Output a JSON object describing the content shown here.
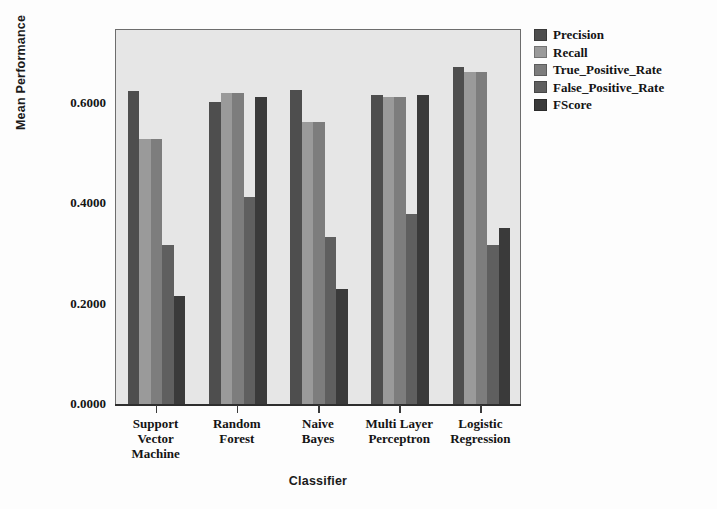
{
  "chart_data": {
    "type": "bar",
    "title": "",
    "xlabel": "Classifier",
    "ylabel": "Mean Performance",
    "ylim": [
      0.0,
      0.75
    ],
    "yticks": [
      "0.0000",
      "0.2000",
      "0.4000",
      "0.6000"
    ],
    "ytick_values": [
      0.0,
      0.2,
      0.4,
      0.6
    ],
    "grid": false,
    "legend_position": "right",
    "categories": [
      "Support Vector Machine",
      "Random Forest",
      "Naive Bayes",
      "Multi Layer Perceptron",
      "Logistic Regression"
    ],
    "category_lines": [
      "Support\nVector\nMachine",
      "Random\nForest",
      "Naive\nBayes",
      "Multi Layer\nPerceptron",
      "Logistic\nRegression"
    ],
    "series": [
      {
        "name": "Precision",
        "color": "#4e4e4e",
        "values": [
          0.625,
          0.603,
          0.626,
          0.617,
          0.673
        ]
      },
      {
        "name": "Recall",
        "color": "#9a9a9a",
        "values": [
          0.528,
          0.621,
          0.562,
          0.613,
          0.662
        ]
      },
      {
        "name": "True_Positive_Rate",
        "color": "#7d7d7d",
        "values": [
          0.528,
          0.621,
          0.562,
          0.613,
          0.662
        ]
      },
      {
        "name": "False_Positive_Rate",
        "color": "#5f5f5f",
        "values": [
          0.318,
          0.413,
          0.334,
          0.379,
          0.318
        ]
      },
      {
        "name": "FScore",
        "color": "#3a3a3a",
        "values": [
          0.215,
          0.612,
          0.23,
          0.617,
          0.352
        ]
      }
    ]
  },
  "style": {
    "plot_background": "#e6e6e6",
    "frame_color": "#6d6d6d",
    "axis_color": "#2e2e2e",
    "text_color": "#141414"
  }
}
